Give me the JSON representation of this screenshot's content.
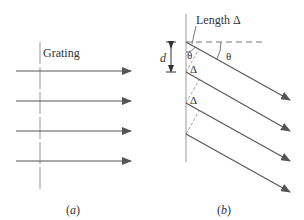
{
  "panel_a": {
    "grating_label": "Grating",
    "caption": "(a)",
    "caption_letter": "a"
  },
  "panel_b": {
    "length_label": "Length Δ",
    "spacing_label": "d",
    "angle_label_1": "θ",
    "angle_label_2": "θ",
    "delta_label_1": "Δ",
    "delta_label_2": "Δ",
    "caption_letter": "b"
  },
  "colors": {
    "line": "#777777",
    "arrow": "#555555",
    "text": "#333333"
  }
}
